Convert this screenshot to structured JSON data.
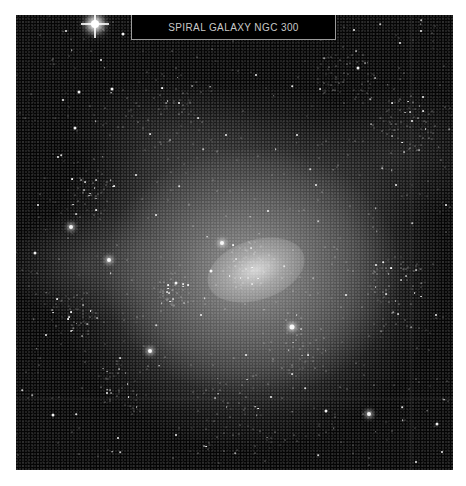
{
  "caption": {
    "title": "SPIRAL GALAXY NGC 300"
  },
  "image": {
    "subject": "spiral-galaxy",
    "background_color": "#050505",
    "border_color": "#9a9a9a",
    "text_color": "#c8c8c8"
  },
  "stars": [
    {
      "x": 79,
      "y": 9,
      "r": 8,
      "bright": true
    },
    {
      "x": 107,
      "y": 19,
      "r": 3
    },
    {
      "x": 63,
      "y": 77,
      "r": 3
    },
    {
      "x": 50,
      "y": 16,
      "r": 2
    },
    {
      "x": 85,
      "y": 45,
      "r": 2
    },
    {
      "x": 55,
      "y": 212,
      "r": 4,
      "glow": true
    },
    {
      "x": 93,
      "y": 245,
      "r": 4,
      "glow": true
    },
    {
      "x": 59,
      "y": 113,
      "r": 3
    },
    {
      "x": 96,
      "y": 74,
      "r": 3
    },
    {
      "x": 47,
      "y": 85,
      "r": 2
    },
    {
      "x": 42,
      "y": 142,
      "r": 2
    },
    {
      "x": 19,
      "y": 238,
      "r": 3
    },
    {
      "x": 206,
      "y": 228,
      "r": 4,
      "glow": true
    },
    {
      "x": 134,
      "y": 336,
      "r": 4,
      "glow": true
    },
    {
      "x": 276,
      "y": 312,
      "r": 5,
      "glow": true
    },
    {
      "x": 163,
      "y": 88,
      "r": 2
    },
    {
      "x": 215,
      "y": 14,
      "r": 2
    },
    {
      "x": 338,
      "y": 15,
      "r": 2
    },
    {
      "x": 405,
      "y": 16,
      "r": 2
    },
    {
      "x": 384,
      "y": 28,
      "r": 2
    },
    {
      "x": 342,
      "y": 53,
      "r": 3
    },
    {
      "x": 407,
      "y": 82,
      "r": 2
    },
    {
      "x": 396,
      "y": 106,
      "r": 2
    },
    {
      "x": 281,
      "y": 120,
      "r": 2
    },
    {
      "x": 353,
      "y": 399,
      "r": 4,
      "glow": true
    },
    {
      "x": 421,
      "y": 409,
      "r": 3
    },
    {
      "x": 426,
      "y": 437,
      "r": 2
    },
    {
      "x": 400,
      "y": 447,
      "r": 2
    },
    {
      "x": 37,
      "y": 400,
      "r": 3
    },
    {
      "x": 102,
      "y": 423,
      "r": 2
    },
    {
      "x": 91,
      "y": 378,
      "r": 2
    },
    {
      "x": 127,
      "y": 461,
      "r": 2
    },
    {
      "x": 195,
      "y": 256,
      "r": 3
    },
    {
      "x": 310,
      "y": 396,
      "r": 3
    },
    {
      "x": 160,
      "y": 268,
      "r": 3
    },
    {
      "x": 252,
      "y": 196,
      "r": 2
    },
    {
      "x": 300,
      "y": 170,
      "r": 2
    },
    {
      "x": 360,
      "y": 250,
      "r": 2
    },
    {
      "x": 185,
      "y": 300,
      "r": 2
    },
    {
      "x": 230,
      "y": 340,
      "r": 2
    },
    {
      "x": 255,
      "y": 382,
      "r": 2
    },
    {
      "x": 160,
      "y": 420,
      "r": 2
    },
    {
      "x": 22,
      "y": 190,
      "r": 2
    },
    {
      "x": 30,
      "y": 320,
      "r": 2
    },
    {
      "x": 420,
      "y": 300,
      "r": 2
    },
    {
      "x": 430,
      "y": 190,
      "r": 2
    },
    {
      "x": 380,
      "y": 170,
      "r": 2
    },
    {
      "x": 330,
      "y": 280,
      "r": 2
    },
    {
      "x": 210,
      "y": 120,
      "r": 2
    },
    {
      "x": 240,
      "y": 60,
      "r": 2
    },
    {
      "x": 120,
      "y": 160,
      "r": 2
    },
    {
      "x": 140,
      "y": 200,
      "r": 2
    }
  ],
  "clusters": [
    {
      "x": 160,
      "y": 275,
      "count": 40,
      "spread": 18
    },
    {
      "x": 60,
      "y": 300,
      "count": 50,
      "spread": 25
    },
    {
      "x": 390,
      "y": 110,
      "count": 60,
      "spread": 30
    },
    {
      "x": 330,
      "y": 60,
      "count": 50,
      "spread": 30
    },
    {
      "x": 75,
      "y": 180,
      "count": 40,
      "spread": 25
    },
    {
      "x": 280,
      "y": 330,
      "count": 40,
      "spread": 30
    },
    {
      "x": 230,
      "y": 250,
      "count": 50,
      "spread": 25
    },
    {
      "x": 150,
      "y": 90,
      "count": 50,
      "spread": 40
    },
    {
      "x": 380,
      "y": 270,
      "count": 50,
      "spread": 30
    },
    {
      "x": 220,
      "y": 400,
      "count": 50,
      "spread": 45
    },
    {
      "x": 110,
      "y": 370,
      "count": 40,
      "spread": 30
    }
  ],
  "field_star_count": 450
}
